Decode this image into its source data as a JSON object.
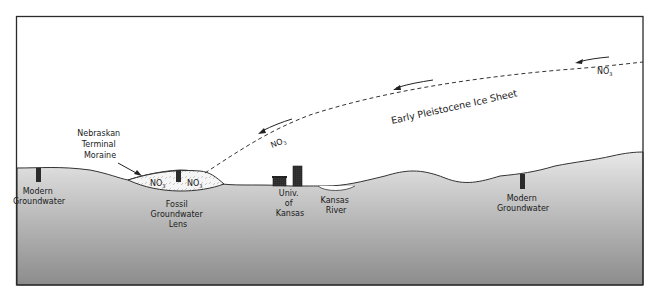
{
  "diagram": {
    "title": "Early Pleistocene Ice Sheet",
    "labels": {
      "ice_sheet": "Early Pleistocene Ice Sheet",
      "moraine": [
        "Nebraskan",
        "Terminal",
        "Moraine"
      ],
      "modern_groundwater_left": [
        "Modern",
        "Groundwater"
      ],
      "fossil_lens": [
        "Fossil",
        "Groundwater",
        "Lens"
      ],
      "university": [
        "Univ.",
        "of",
        "Kansas"
      ],
      "river": [
        "Kansas",
        "River"
      ],
      "modern_groundwater_right": [
        "Modern",
        "Groundwater"
      ]
    },
    "nitrate": {
      "base": "NO",
      "subscript": "3",
      "markers": [
        {
          "id": "nitrate-ice-right"
        },
        {
          "id": "nitrate-ice-middle"
        },
        {
          "id": "nitrate-lens-left"
        },
        {
          "id": "nitrate-lens-right"
        }
      ]
    },
    "colors": {
      "ground_top": "#e6e6e6",
      "ground_bottom": "#8a8a8a",
      "frame": "#2a2a2a",
      "well": "#2b2b2b",
      "lens_fill": "#f4f4f4"
    }
  }
}
